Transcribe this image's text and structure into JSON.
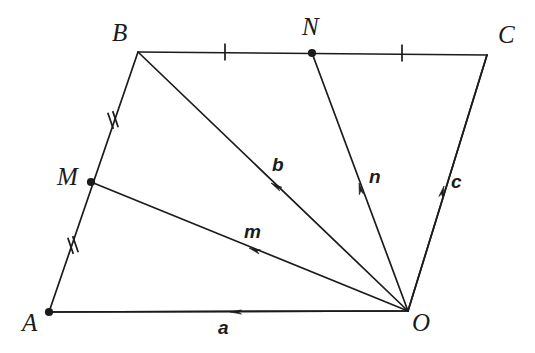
{
  "figure": {
    "background_color": "#ffffff",
    "stroke_color": "#1b1b1b",
    "width": 535,
    "height": 353
  },
  "points": [
    {
      "id": "A",
      "label": "A",
      "x": 49,
      "y": 312,
      "dot": true,
      "label_x": 22,
      "label_y": 310
    },
    {
      "id": "B",
      "label": "B",
      "x": 138,
      "y": 52,
      "dot": false,
      "label_x": 112,
      "label_y": 20
    },
    {
      "id": "C",
      "label": "C",
      "x": 487,
      "y": 55,
      "dot": false,
      "label_x": 498,
      "label_y": 22
    },
    {
      "id": "O",
      "label": "O",
      "x": 408,
      "y": 311,
      "dot": false,
      "label_x": 412,
      "label_y": 310
    },
    {
      "id": "M",
      "label": "M",
      "x": 91,
      "y": 182,
      "dot": true,
      "label_x": 57,
      "label_y": 164
    },
    {
      "id": "N",
      "label": "N",
      "x": 312,
      "y": 53,
      "dot": true,
      "label_x": 302,
      "label_y": 14
    }
  ],
  "edges": [
    {
      "id": "edge-AB",
      "from": "A",
      "to": "B",
      "description": "side A to B through M"
    },
    {
      "id": "edge-BC",
      "from": "B",
      "to": "C",
      "description": "side B to C through N"
    },
    {
      "id": "edge-CO",
      "from": "C",
      "to": "O",
      "description": "side C to O"
    },
    {
      "id": "edge-AO",
      "from": "A",
      "to": "O",
      "description": "side A to O"
    }
  ],
  "vectors": [
    {
      "id": "vector-a",
      "label": "a",
      "from": "O",
      "to": "A",
      "arrow_x": 230,
      "arrow_y": 312,
      "arrow_angle": 180,
      "label_x": 218,
      "label_y": 318
    },
    {
      "id": "vector-m",
      "label": "m",
      "from": "O",
      "to": "M",
      "arrow_x": 249,
      "arrow_y": 248,
      "arrow_angle": 200,
      "label_x": 244,
      "label_y": 222
    },
    {
      "id": "vector-b",
      "label": "b",
      "from": "O",
      "to": "B",
      "arrow_x": 271,
      "arrow_y": 183,
      "arrow_angle": 212,
      "label_x": 272,
      "label_y": 155
    },
    {
      "id": "vector-n",
      "label": "n",
      "from": "O",
      "to": "N",
      "arrow_x": 359,
      "arrow_y": 183,
      "arrow_angle": 258,
      "label_x": 369,
      "label_y": 167
    },
    {
      "id": "vector-c",
      "label": "c",
      "from": "O",
      "to": "C",
      "arrow_x": 444,
      "arrow_y": 186,
      "arrow_angle": 286,
      "label_x": 451,
      "label_y": 172
    }
  ],
  "tick_marks": [
    {
      "id": "tick-BN",
      "on_edge": "edge-BC",
      "x": 225,
      "y": 52,
      "count": 1,
      "angle": 0,
      "description": "congruence tick on segment BN"
    },
    {
      "id": "tick-NC",
      "on_edge": "edge-BC",
      "x": 402,
      "y": 53,
      "count": 1,
      "angle": 0,
      "description": "congruence tick on segment NC"
    },
    {
      "id": "tick-BM",
      "on_edge": "edge-AB",
      "x": 113,
      "y": 120,
      "count": 2,
      "angle": -19,
      "description": "double congruence tick on segment BM"
    },
    {
      "id": "tick-MA",
      "on_edge": "edge-AB",
      "x": 73,
      "y": 245,
      "count": 2,
      "angle": -19,
      "description": "double congruence tick on segment MA"
    }
  ]
}
